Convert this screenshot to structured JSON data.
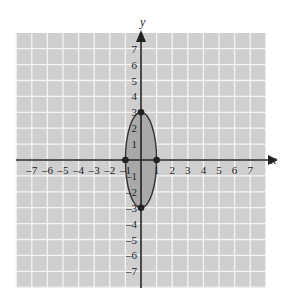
{
  "figure": {
    "type": "coordinate-plane",
    "grid": {
      "xmin": -8,
      "xmax": 8,
      "ymin": -8,
      "ymax": 8,
      "step": 1,
      "background": "#cfcfcf",
      "line_color": "#f4f4f4"
    },
    "axes": {
      "x_label": "x",
      "y_label": "y",
      "x_ticks": [
        "-7",
        "-6",
        "-5",
        "-4",
        "-3",
        "-2",
        "-1",
        "1",
        "2",
        "3",
        "4",
        "5",
        "6",
        "7"
      ],
      "y_ticks": [
        "7",
        "6",
        "5",
        "4",
        "3",
        "2",
        "1",
        "-1",
        "-2",
        "-3",
        "-4",
        "-5",
        "-6",
        "-7"
      ],
      "color": "#222222"
    },
    "ellipse": {
      "equation": "x^2/1 + y^2/9 = 1",
      "center": [
        0,
        0
      ],
      "semi_x": 1,
      "semi_y": 3,
      "fill": "#a9a9a9",
      "stroke": "#333333"
    },
    "points": [
      {
        "label": "(0,3)",
        "x": 0,
        "y": 3
      },
      {
        "label": "(0,-3)",
        "x": 0,
        "y": -3
      },
      {
        "label": "(-1,0)",
        "x": -1,
        "y": 0
      },
      {
        "label": "(1,0)",
        "x": 1,
        "y": 0
      }
    ]
  },
  "chart_data": {
    "type": "scatter",
    "title": "",
    "xlabel": "x",
    "ylabel": "y",
    "xlim": [
      -8,
      8
    ],
    "ylim": [
      -8,
      8
    ],
    "grid": true,
    "x_tick_labels": [
      -7,
      -6,
      -5,
      -4,
      -3,
      -2,
      -1,
      1,
      2,
      3,
      4,
      5,
      6,
      7
    ],
    "y_tick_labels": [
      -7,
      -6,
      -5,
      -4,
      -3,
      -2,
      -1,
      1,
      2,
      3,
      4,
      5,
      6,
      7
    ],
    "series": [
      {
        "name": "ellipse x^2 + y^2/9 = 1",
        "shape": "ellipse",
        "center": [
          0,
          0
        ],
        "rx": 1,
        "ry": 3,
        "filled": true
      },
      {
        "name": "vertices/intercepts",
        "x": [
          0,
          0,
          -1,
          1
        ],
        "y": [
          3,
          -3,
          0,
          0
        ]
      }
    ]
  }
}
